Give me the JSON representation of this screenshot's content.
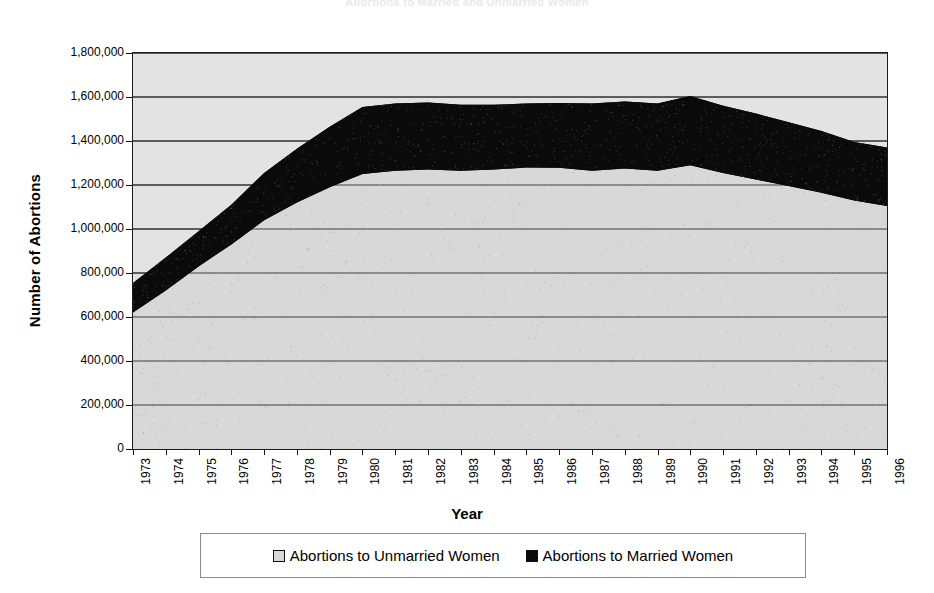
{
  "page": {
    "faded_top_title": "Abortions to Married and Unmarried Women",
    "background": "#ffffff"
  },
  "axes": {
    "y_title": "Number of Abortions",
    "x_title": "Year"
  },
  "legend": {
    "items": [
      {
        "label": "Abortions to Unmarried Women",
        "swatch": "light",
        "color": "#d8d8d8"
      },
      {
        "label": "Abortions to Married Women",
        "swatch": "dark",
        "color": "#0a0a0a"
      }
    ]
  },
  "chart_data": {
    "type": "area",
    "stacked": true,
    "title": "Abortions to Married and Unmarried Women",
    "xlabel": "Year",
    "ylabel": "Number of Abortions",
    "grid": true,
    "legend_position": "bottom",
    "ylim": [
      0,
      1800000
    ],
    "ytick_labels": [
      "0",
      "200,000",
      "400,000",
      "600,000",
      "800,000",
      "1,000,000",
      "1,200,000",
      "1,400,000",
      "1,600,000",
      "1,800,000"
    ],
    "yticks": [
      0,
      200000,
      400000,
      600000,
      800000,
      1000000,
      1200000,
      1400000,
      1600000,
      1800000
    ],
    "categories": [
      "1973",
      "1974",
      "1975",
      "1976",
      "1977",
      "1978",
      "1979",
      "1980",
      "1981",
      "1982",
      "1983",
      "1984",
      "1985",
      "1986",
      "1987",
      "1988",
      "1989",
      "1990",
      "1991",
      "1992",
      "1993",
      "1994",
      "1995",
      "1996"
    ],
    "series": [
      {
        "name": "Abortions to Unmarried Women",
        "color": "#d8d8d8",
        "values": [
          620000,
          720000,
          830000,
          930000,
          1040000,
          1120000,
          1190000,
          1250000,
          1265000,
          1270000,
          1265000,
          1270000,
          1280000,
          1278000,
          1265000,
          1275000,
          1265000,
          1290000,
          1255000,
          1225000,
          1195000,
          1165000,
          1130000,
          1105000
        ]
      },
      {
        "name": "Abortions to Married Women",
        "color": "#0a0a0a",
        "values": [
          135000,
          150000,
          160000,
          180000,
          215000,
          245000,
          275000,
          305000,
          305000,
          305000,
          300000,
          295000,
          290000,
          295000,
          305000,
          305000,
          305000,
          315000,
          305000,
          300000,
          290000,
          280000,
          265000,
          265000
        ]
      }
    ],
    "totals": [
      755000,
      870000,
      990000,
      1110000,
      1255000,
      1365000,
      1465000,
      1555000,
      1570000,
      1575000,
      1565000,
      1565000,
      1570000,
      1573000,
      1570000,
      1580000,
      1570000,
      1605000,
      1560000,
      1525000,
      1485000,
      1445000,
      1395000,
      1370000
    ]
  }
}
